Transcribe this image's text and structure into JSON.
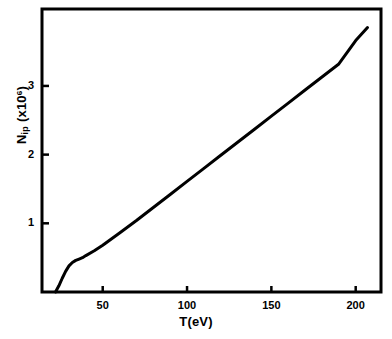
{
  "chart_data": {
    "type": "line",
    "title": "",
    "xlabel": "T(eV)",
    "ylabel_parts": {
      "base": "N",
      "subscript": "ip",
      "scale_open": "(x10",
      "exponent": "6",
      "scale_close": ")"
    },
    "ylabel": "N ip (x10^6)",
    "xlim": [
      14,
      215
    ],
    "ylim": [
      0,
      4.12
    ],
    "grid": false,
    "legend": null,
    "xticks": [
      50,
      100,
      150,
      200
    ],
    "xtick_labels": [
      "50",
      "100",
      "150",
      "200"
    ],
    "yticks": [
      1,
      2,
      3
    ],
    "ytick_labels": [
      "1",
      "2",
      "3"
    ],
    "series": [
      {
        "name": "N_ip",
        "color": "#000000",
        "linewidth": 3,
        "x": [
          22,
          24,
          26,
          28,
          30,
          32,
          34,
          36,
          38,
          40,
          45,
          50,
          60,
          70,
          80,
          90,
          100,
          110,
          120,
          130,
          140,
          150,
          160,
          170,
          180,
          190,
          200,
          207
        ],
        "y": [
          0.0,
          0.09,
          0.2,
          0.3,
          0.38,
          0.43,
          0.46,
          0.48,
          0.5,
          0.53,
          0.6,
          0.68,
          0.86,
          1.04,
          1.23,
          1.42,
          1.61,
          1.8,
          1.99,
          2.18,
          2.37,
          2.56,
          2.75,
          2.94,
          3.13,
          3.32,
          3.66,
          3.85
        ]
      }
    ]
  },
  "axes": {
    "x_axis_name": "temperature-axis",
    "y_axis_name": "ion-number-axis"
  }
}
